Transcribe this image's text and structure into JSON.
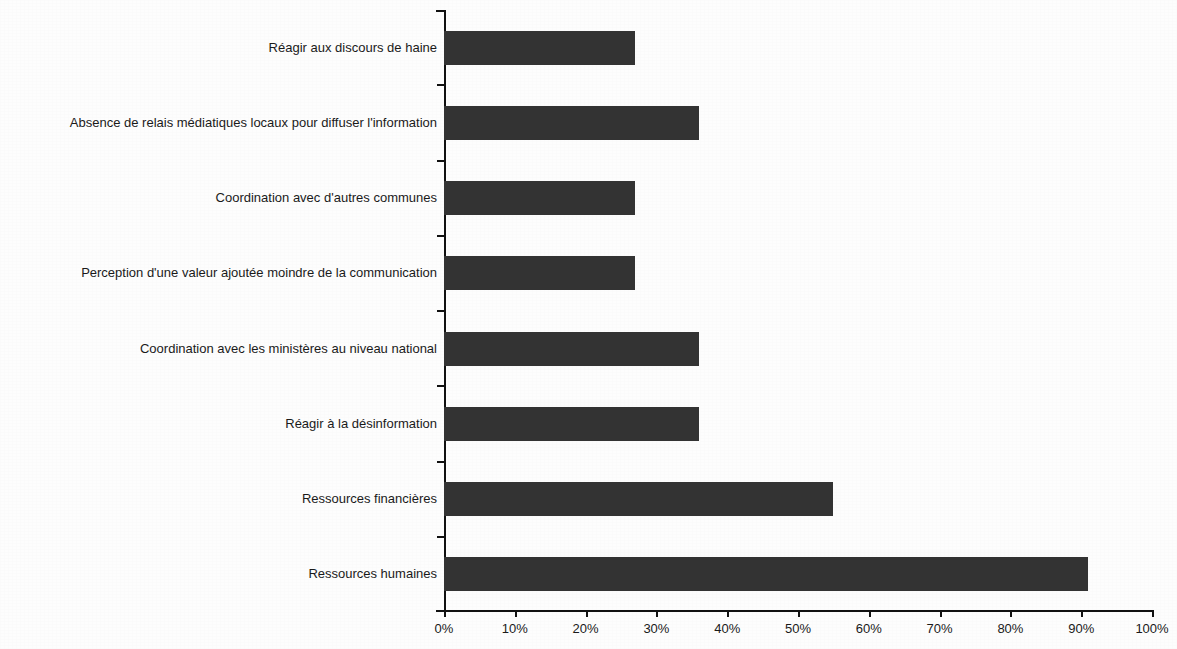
{
  "chart_data": {
    "type": "bar",
    "orientation": "horizontal",
    "title": "",
    "subtitle": "",
    "xlabel": "",
    "ylabel": "",
    "xlim": [
      0,
      100
    ],
    "xunit": "%",
    "grid": false,
    "legend": null,
    "bar_color": "#333333",
    "axis_color": "#111111",
    "background_color": "#ffffff",
    "categories": [
      "Réagir aux discours de haine",
      "Absence de relais médiatiques locaux pour diffuser l'information",
      "Coordination avec d'autres communes",
      "Perception d'une valeur ajoutée moindre de la communication",
      "Coordination avec les ministères au niveau national",
      "Réagir à la désinformation",
      "Ressources financières",
      "Ressources humaines"
    ],
    "values": [
      27,
      36,
      27,
      27,
      36,
      36,
      55,
      91
    ],
    "xticks": [
      0,
      10,
      20,
      30,
      40,
      50,
      60,
      70,
      80,
      90,
      100
    ],
    "xtick_labels": [
      "0%",
      "10%",
      "20%",
      "30%",
      "40%",
      "50%",
      "60%",
      "70%",
      "80%",
      "90%",
      "100%"
    ]
  }
}
